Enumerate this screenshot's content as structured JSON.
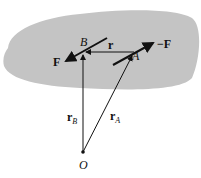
{
  "diagram": {
    "labels": {
      "B": "B",
      "A": "A",
      "r": "r",
      "F": "F",
      "negF": "−F",
      "rB_main": "r",
      "rB_sub": "B",
      "rA_main": "r",
      "rA_sub": "A",
      "O": "O"
    },
    "colors": {
      "body": "#c4c4c4",
      "line": "#111111"
    }
  }
}
